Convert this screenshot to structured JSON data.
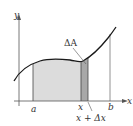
{
  "diagram": {
    "type": "area-under-curve",
    "axes": {
      "x_label": "x",
      "y_label": "y"
    },
    "labels": {
      "a": "a",
      "x": "x",
      "x_plus_dx": "x + Δx",
      "b": "b",
      "delta_A": "ΔA"
    },
    "colors": {
      "curve": "#1a1a1a",
      "axis": "#555555",
      "region_fill": "#dcdcdc",
      "strip_fill": "#a8a8a8",
      "background": "#ffffff"
    }
  }
}
